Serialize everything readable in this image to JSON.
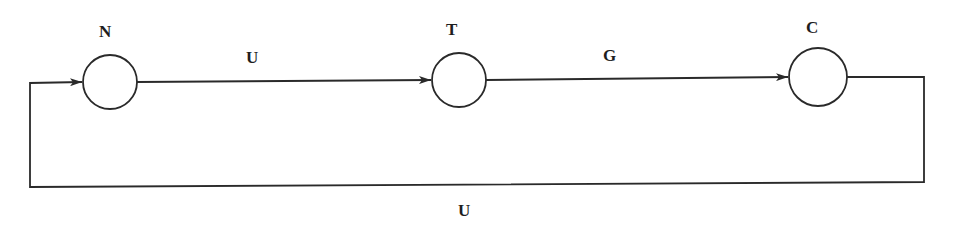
{
  "diagram": {
    "type": "state-cycle",
    "stroke_color": "#2a2a2a",
    "background": "#ffffff",
    "nodes": [
      {
        "id": "N",
        "label": "N",
        "cx": 110,
        "cy": 82,
        "r": 27,
        "label_x": 99,
        "label_y": 37
      },
      {
        "id": "T",
        "label": "T",
        "cx": 459,
        "cy": 80,
        "r": 27,
        "label_x": 446,
        "label_y": 35
      },
      {
        "id": "C",
        "label": "C",
        "cx": 818,
        "cy": 77,
        "r": 29,
        "label_x": 806,
        "label_y": 33
      }
    ],
    "edges": [
      {
        "id": "N-T",
        "from": "N",
        "to": "T",
        "label": "U",
        "label_x": 246,
        "label_y": 63
      },
      {
        "id": "T-C",
        "from": "T",
        "to": "C",
        "label": "G",
        "label_x": 603,
        "label_y": 61
      },
      {
        "id": "C-N",
        "from": "C",
        "to": "N",
        "label": "U",
        "label_x": 458,
        "label_y": 216,
        "routing": "loop-below"
      }
    ]
  }
}
